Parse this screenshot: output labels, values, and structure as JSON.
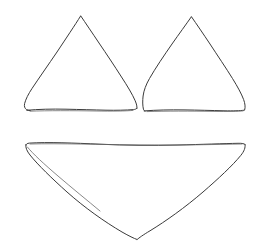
{
  "document": {
    "title": "Hand-drawn triangle sketch",
    "description": "Line drawing of three hand-drawn triangles: two upward-pointing triangles side by side on top and one large downward-pointing triangle below",
    "background_color": "#ffffff",
    "stroke_color": "#3a3a3a",
    "stroke_color_light": "#6a6a6a",
    "stroke_width": 1,
    "width": 260,
    "height": 241
  },
  "chart_data": {
    "type": "scatter",
    "xlabel": "",
    "ylabel": "",
    "xlim": [
      0,
      260
    ],
    "ylim": [
      241,
      0
    ],
    "grid": false,
    "legend": "none",
    "shapes": [
      {
        "name": "upper-left-triangle",
        "orientation": "up",
        "vertices": [
          [
            80,
            16
          ],
          [
            136,
            110
          ],
          [
            25,
            110
          ]
        ],
        "apex": [
          80,
          16
        ],
        "base_y": 110,
        "base_x_range": [
          25,
          136
        ],
        "width": 111,
        "height": 94
      },
      {
        "name": "upper-right-triangle",
        "orientation": "up",
        "vertices": [
          [
            191,
            17
          ],
          [
            245,
            110
          ],
          [
            143,
            110
          ]
        ],
        "apex": [
          191,
          17
        ],
        "base_y": 110,
        "base_x_range": [
          143,
          245
        ],
        "width": 102,
        "height": 93
      },
      {
        "name": "lower-triangle",
        "orientation": "down",
        "vertices": [
          [
            25,
            144
          ],
          [
            245,
            144
          ],
          [
            137,
            239
          ]
        ],
        "apex": [
          137,
          239
        ],
        "top_y": 144,
        "top_x_range": [
          25,
          245
        ],
        "width": 220,
        "height": 95
      }
    ]
  },
  "shapes": {
    "upper_left_label": "Upper left triangle",
    "upper_right_label": "Upper right triangle",
    "lower_label": "Lower downward triangle"
  }
}
